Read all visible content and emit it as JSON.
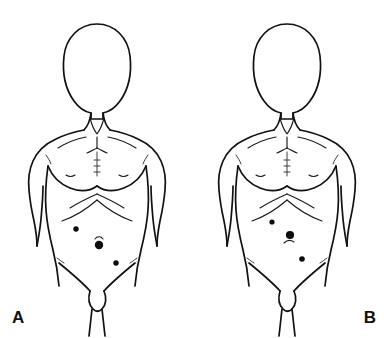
{
  "figure": {
    "background_color": "#ffffff",
    "line_color": "#111111",
    "marker_color": "#0d0d0d",
    "width": 389,
    "height": 338
  },
  "panels": [
    {
      "id": "A",
      "label": "A",
      "subject": "male-torso-anterior-view",
      "description": "Anterior view of male torso with three marked port sites arranged around the umbilicus",
      "ports": [
        {
          "name": "left-upper-quadrant-port",
          "position_label": "upper left",
          "cx": 76,
          "cy": 229,
          "r": 2.7,
          "size": "small"
        },
        {
          "name": "umbilical-port",
          "position_label": "umbilicus",
          "cx": 99,
          "cy": 245,
          "r": 4.2,
          "size": "large"
        },
        {
          "name": "right-lower-quadrant-port",
          "position_label": "lower right",
          "cx": 116,
          "cy": 263,
          "r": 2.7,
          "size": "small"
        }
      ],
      "umbilicus_crease": true
    },
    {
      "id": "B",
      "label": "B",
      "subject": "male-torso-anterior-view",
      "description": "Anterior view of male torso with three marked port sites in an alternate configuration",
      "ports": [
        {
          "name": "left-upper-quadrant-port",
          "position_label": "upper left",
          "cx": 77,
          "cy": 222,
          "r": 2.6,
          "size": "small"
        },
        {
          "name": "umbilical-port",
          "position_label": "umbilicus",
          "cx": 95,
          "cy": 235,
          "r": 4.1,
          "size": "large"
        },
        {
          "name": "right-lower-quadrant-port",
          "position_label": "lower right",
          "cx": 107,
          "cy": 259,
          "r": 2.8,
          "size": "small"
        }
      ],
      "umbilicus_crease": true
    }
  ]
}
